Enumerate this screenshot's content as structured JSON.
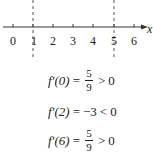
{
  "axis": {
    "label": "x",
    "ticks": [
      "0",
      "1",
      "2",
      "3",
      "4",
      "5",
      "6"
    ],
    "critical_points": [
      "1",
      "5"
    ]
  },
  "equations": [
    {
      "lhs": "f′(0)",
      "eq": "=",
      "num": "5",
      "den": "9",
      "rel": ">",
      "rhs": "0"
    },
    {
      "lhs": "f′(2)",
      "eq": "=",
      "value": "−3",
      "rel": "<",
      "rhs": "0"
    },
    {
      "lhs": "f′(6)",
      "eq": "=",
      "num": "5",
      "den": "9",
      "rel": ">",
      "rhs": "0"
    }
  ]
}
